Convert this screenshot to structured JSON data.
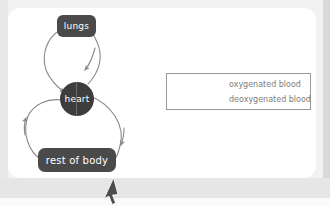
{
  "page": {
    "background_color": "#f2f2f2",
    "card_color": "#ffffff"
  },
  "diagram": {
    "type": "flow-diagram",
    "node_color": "#4a4a4a",
    "heart_color": "#3d3d3d",
    "stroke_color": "#8a8a8a",
    "nodes": [
      {
        "id": "lungs",
        "label": "lungs",
        "shape": "rounded-rect",
        "x": 57,
        "y": 15,
        "w": 39,
        "h": 22
      },
      {
        "id": "heart",
        "label": "heart",
        "shape": "circle-split",
        "x": 60,
        "y": 82,
        "w": 34,
        "h": 34
      },
      {
        "id": "body",
        "label": "rest of body",
        "shape": "rounded-rect",
        "x": 38,
        "y": 148,
        "w": 78,
        "h": 24
      }
    ],
    "edges": [
      {
        "id": "heart-to-lungs",
        "from": "heart",
        "to": "lungs",
        "blood": "deoxygenated",
        "side": "right"
      },
      {
        "id": "lungs-to-heart",
        "from": "lungs",
        "to": "heart",
        "blood": "oxygenated",
        "side": "left"
      },
      {
        "id": "heart-to-body",
        "from": "heart",
        "to": "body",
        "blood": "oxygenated",
        "side": "right"
      },
      {
        "id": "body-to-heart",
        "from": "body",
        "to": "heart",
        "blood": "deoxygenated",
        "side": "left"
      }
    ]
  },
  "legend": {
    "border_color": "#9a9a9a",
    "text_color": "#7d7d7d",
    "items": [
      {
        "key": "oxygenated",
        "label": "oxygenated blood",
        "color": "#8a8a8a"
      },
      {
        "key": "deoxygenated",
        "label": "deoxygenated blood",
        "color": "#8a8a8a"
      }
    ]
  },
  "cursor": {
    "name": "mouse-pointer",
    "x": 102,
    "y": 178,
    "color": "#4d4d4d"
  }
}
